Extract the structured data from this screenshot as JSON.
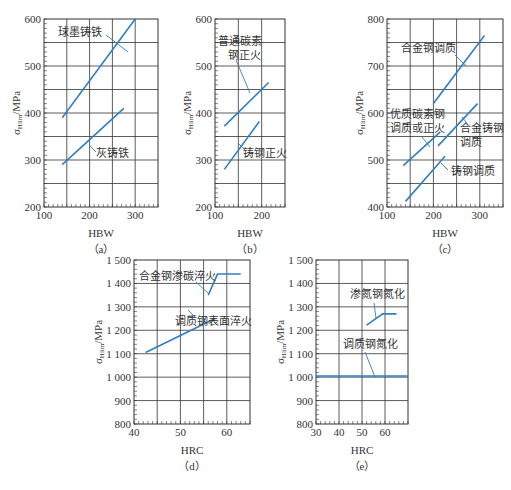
{
  "chart_data": [
    {
      "id": "a",
      "type": "line",
      "panel_label": "（a）",
      "xlabel": "HBW",
      "ylabel": "σHlim/MPa",
      "xlim": [
        100,
        350
      ],
      "ylim": [
        200,
        600
      ],
      "xticks": [
        100,
        200,
        300
      ],
      "yticks": [
        200,
        300,
        400,
        500,
        600
      ],
      "grid": true,
      "series": [
        {
          "name": "球墨铸铁",
          "points": [
            [
              140,
              390
            ],
            [
              300,
              600
            ]
          ]
        },
        {
          "name": "灰铸铁",
          "points": [
            [
              140,
              290
            ],
            [
              275,
              410
            ]
          ]
        }
      ]
    },
    {
      "id": "b",
      "type": "line",
      "panel_label": "（b）",
      "xlabel": "HBW",
      "ylabel": "σHlim/MPa",
      "xlim": [
        100,
        250
      ],
      "ylim": [
        200,
        600
      ],
      "xticks": [
        100,
        200
      ],
      "yticks": [
        200,
        300,
        400,
        500,
        600
      ],
      "grid": true,
      "series": [
        {
          "name": "普通碳素钢正火",
          "points": [
            [
              120,
              372
            ],
            [
              215,
              465
            ]
          ]
        },
        {
          "name": "铸钢正火",
          "points": [
            [
              120,
              280
            ],
            [
              195,
              382
            ]
          ]
        }
      ]
    },
    {
      "id": "c",
      "type": "line",
      "panel_label": "（c）",
      "xlabel": "HBW",
      "ylabel": "σHlim/MPa",
      "xlim": [
        100,
        350
      ],
      "ylim": [
        400,
        800
      ],
      "xticks": [
        100,
        200,
        300
      ],
      "yticks": [
        400,
        500,
        600,
        700,
        800
      ],
      "grid": true,
      "series": [
        {
          "name": "合金钢调质",
          "points": [
            [
              200,
              620
            ],
            [
              310,
              765
            ]
          ]
        },
        {
          "name": "优质碳素钢调质或正火",
          "points": [
            [
              135,
              488
            ],
            [
              215,
              560
            ]
          ]
        },
        {
          "name": "合金铸钢调质",
          "points": [
            [
              210,
              530
            ],
            [
              295,
              620
            ]
          ]
        },
        {
          "name": "铸钢调质",
          "points": [
            [
              140,
              412
            ],
            [
              225,
              508
            ]
          ]
        }
      ]
    },
    {
      "id": "d",
      "type": "line",
      "panel_label": "（d）",
      "xlabel": "HRC",
      "ylabel": "σHlim/MPa",
      "xlim": [
        40,
        65
      ],
      "ylim": [
        800,
        1500
      ],
      "xticks": [
        40,
        50,
        60
      ],
      "yticks": [
        "800",
        "900",
        "1 000",
        "1 100",
        "1 200",
        "1 300",
        "1 400",
        "1 500"
      ],
      "grid": true,
      "series": [
        {
          "name": "合金钢渗碳淬火",
          "points": [
            [
              56,
              1350
            ],
            [
              58,
              1440
            ],
            [
              63,
              1440
            ]
          ]
        },
        {
          "name": "调质钢表面淬火",
          "points": [
            [
              42.5,
              1105
            ],
            [
              57.5,
              1250
            ]
          ]
        }
      ]
    },
    {
      "id": "e",
      "type": "line",
      "panel_label": "（e）",
      "xlabel": "HRC",
      "ylabel": "σHlim/MPa",
      "xlim": [
        30,
        70
      ],
      "ylim": [
        800,
        1500
      ],
      "xticks": [
        30,
        40,
        50,
        60
      ],
      "yticks": [
        "800",
        "900",
        "1 000",
        "1 100",
        "1 200",
        "1 300",
        "1 400",
        "1 500"
      ],
      "grid": true,
      "series": [
        {
          "name": "渗氮钢氮化",
          "points": [
            [
              52,
              1222
            ],
            [
              59,
              1270
            ],
            [
              65,
              1270
            ]
          ]
        },
        {
          "name": "调质钢氮化",
          "points": [
            [
              30,
              1005
            ],
            [
              70,
              1005
            ]
          ]
        }
      ]
    }
  ],
  "colors": {
    "series": "#2f7fc1",
    "grid": "#333333"
  }
}
